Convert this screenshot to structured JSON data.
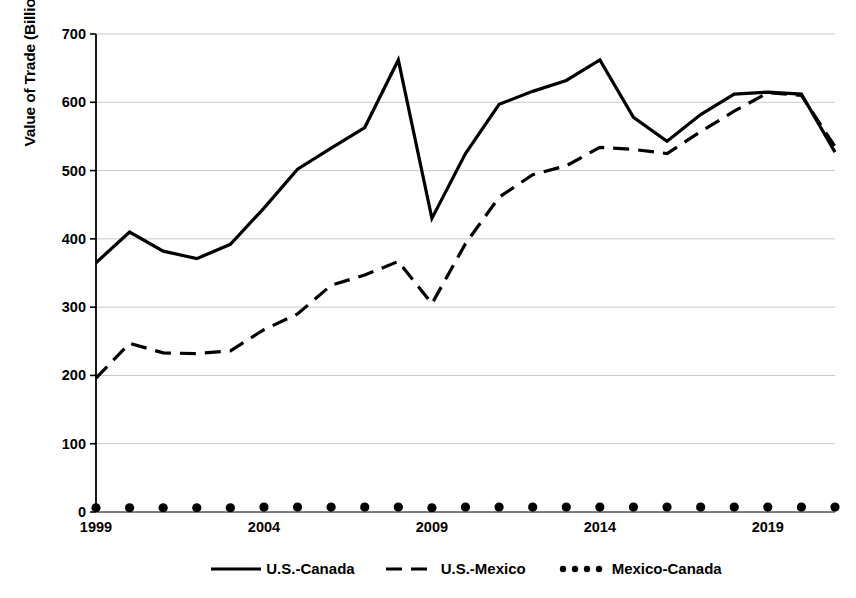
{
  "chart_data": {
    "type": "line",
    "title": "",
    "xlabel": "",
    "ylabel": "Value of Trade (Billions USD)",
    "xlim": [
      1999,
      2021
    ],
    "ylim": [
      0,
      700
    ],
    "ytick_values": [
      0,
      100,
      200,
      300,
      400,
      500,
      600,
      700
    ],
    "ytick_labels": [
      "0",
      "100",
      "200",
      "300",
      "400",
      "500",
      "600",
      "700"
    ],
    "xtick_values": [
      1999,
      2004,
      2009,
      2014,
      2019
    ],
    "xtick_labels": [
      "1999",
      "2004",
      "2009",
      "2014",
      "2019"
    ],
    "x": [
      1999,
      2000,
      2001,
      2002,
      2003,
      2004,
      2005,
      2006,
      2007,
      2008,
      2009,
      2010,
      2011,
      2012,
      2013,
      2014,
      2015,
      2016,
      2017,
      2018,
      2019,
      2020,
      2021
    ],
    "grid": "horizontal",
    "legend_position": "bottom",
    "series": [
      {
        "name": "U.S.-Canada",
        "style": "solid",
        "color": "#000000",
        "values": [
          365,
          410,
          382,
          371,
          392,
          445,
          502,
          533,
          563,
          662,
          430,
          525,
          597,
          616,
          632,
          662,
          578,
          543,
          582,
          612,
          615,
          612,
          527
        ]
      },
      {
        "name": "U.S.-Mexico",
        "style": "dashed",
        "color": "#000000",
        "values": [
          196,
          247,
          233,
          232,
          236,
          267,
          290,
          332,
          347,
          367,
          305,
          393,
          461,
          494,
          507,
          534,
          531,
          525,
          557,
          587,
          614,
          610,
          535
        ]
      },
      {
        "name": "Mexico-Canada",
        "style": "dotted",
        "color": "#000000",
        "values": [
          4,
          4,
          4,
          4,
          4,
          5,
          5,
          5,
          5,
          5,
          4,
          5,
          5,
          5,
          5,
          5,
          5,
          5,
          5,
          5,
          5,
          5,
          5
        ]
      }
    ]
  },
  "legend": {
    "items": [
      {
        "label": "U.S.-Canada",
        "swatch": "solid-line-swatch"
      },
      {
        "label": "U.S.-Mexico",
        "swatch": "dashed-line-swatch"
      },
      {
        "label": "Mexico-Canada",
        "swatch": "dotted-line-swatch"
      }
    ]
  }
}
